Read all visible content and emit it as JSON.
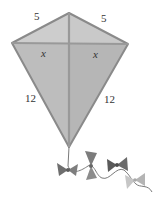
{
  "figure": {
    "type": "kite",
    "labels": {
      "top_left_side": "5",
      "top_right_side": "5",
      "left_half_diagonal": "x",
      "right_half_diagonal": "x",
      "bottom_left_side": "12",
      "bottom_right_side": "12"
    },
    "colors": {
      "kite_fill": "#c4c4c4",
      "kite_fill_dark": "#b2b2b2",
      "kite_edge": "#8a8a8a",
      "spar": "#9a9a9a",
      "bow_dark": "#6e6e6e",
      "bow_mid": "#8c8c8c",
      "bow_light": "#bcbcbc",
      "string": "#7a7a7a",
      "text": "#333333"
    }
  }
}
